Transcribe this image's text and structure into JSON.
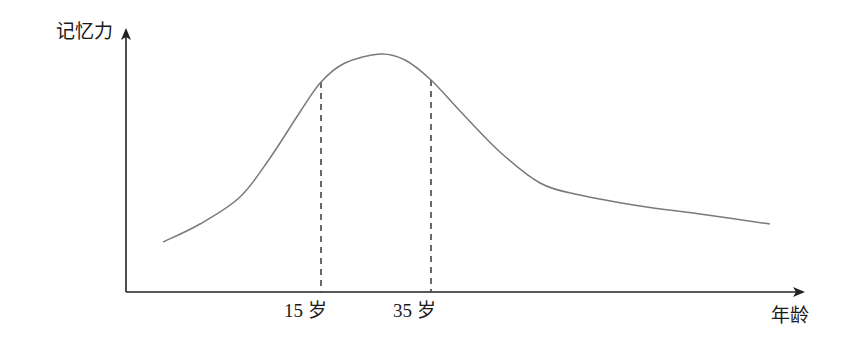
{
  "chart_data": {
    "type": "line",
    "title": "",
    "xlabel": "年龄",
    "ylabel": "记忆力",
    "x_ticks": [
      {
        "label": "15 岁",
        "px": 321
      },
      {
        "label": "35 岁",
        "px": 431
      }
    ],
    "series": [
      {
        "name": "记忆力曲线",
        "color": "#7a7a7a",
        "points_px": [
          [
            163,
            242
          ],
          [
            200,
            224
          ],
          [
            240,
            197
          ],
          [
            270,
            158
          ],
          [
            300,
            112
          ],
          [
            321,
            82
          ],
          [
            345,
            63
          ],
          [
            380,
            54
          ],
          [
            405,
            60
          ],
          [
            431,
            80
          ],
          [
            460,
            111
          ],
          [
            500,
            152
          ],
          [
            540,
            183
          ],
          [
            580,
            195
          ],
          [
            640,
            206
          ],
          [
            700,
            214
          ],
          [
            770,
            224
          ]
        ]
      }
    ],
    "reference_lines": [
      {
        "x_label": "15 岁",
        "style": "dashed"
      },
      {
        "x_label": "35 岁",
        "style": "dashed"
      }
    ],
    "grid": false,
    "legend": "none"
  },
  "labels": {
    "y_axis": "记忆力",
    "x_axis": "年龄",
    "tick_15": "15 岁",
    "tick_35": "35 岁"
  },
  "colors": {
    "axis": "#222222",
    "curve": "#7a7a7a",
    "dashed": "#444444"
  }
}
